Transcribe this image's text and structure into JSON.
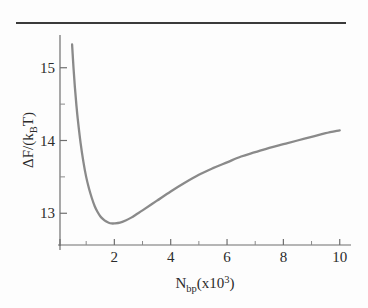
{
  "figure": {
    "background_color": "#fdfdfd",
    "rule_color": "#3a3a3a",
    "curve_color": "#8a8a8a",
    "axis_color": "#6f6f6f",
    "text_color": "#2b2b2b"
  },
  "axis_titles": {
    "y_delta": "Δ",
    "y_f_slash": "F/(k",
    "y_sub": "B",
    "y_tail": "T)",
    "x_n": "N",
    "x_sub": "bp",
    "x_paren_open": "(x10",
    "x_sup": "3",
    "x_paren_close": ")"
  },
  "ticks": {
    "x_major_labels": [
      "2",
      "4",
      "6",
      "8",
      "10"
    ],
    "y_major_labels": [
      "13",
      "14",
      "15"
    ]
  },
  "chart_data": {
    "type": "line",
    "title": "",
    "xlabel": "N_bp(x10^3)",
    "ylabel": "ΔF/(k_B T)",
    "xlim": [
      0,
      10.4
    ],
    "ylim": [
      12.55,
      15.45
    ],
    "grid": false,
    "legend": null,
    "x_ticks_major": [
      2,
      4,
      6,
      8,
      10
    ],
    "x_ticks_minor": [
      1,
      3,
      5,
      7,
      9
    ],
    "y_ticks_major": [
      13,
      14,
      15
    ],
    "y_ticks_minor": [
      13.5,
      14.5
    ],
    "series": [
      {
        "name": "Free energy difference",
        "color": "#8a8a8a",
        "minimum": {
          "x": 2.0,
          "y": 12.87
        },
        "x": [
          0.5,
          0.55,
          0.6,
          0.65,
          0.7,
          0.8,
          0.9,
          1.0,
          1.1,
          1.2,
          1.3,
          1.4,
          1.5,
          1.6,
          1.7,
          1.8,
          1.9,
          2.0,
          2.2,
          2.4,
          2.6,
          2.8,
          3.0,
          3.5,
          4.0,
          4.5,
          5.0,
          5.5,
          6.0,
          6.5,
          7.0,
          7.5,
          8.0,
          8.5,
          9.0,
          9.5,
          10.0
        ],
        "y": [
          15.32,
          15.0,
          14.73,
          14.5,
          14.3,
          13.97,
          13.71,
          13.5,
          13.34,
          13.21,
          13.1,
          13.02,
          12.96,
          12.92,
          12.89,
          12.87,
          12.86,
          12.86,
          12.87,
          12.9,
          12.94,
          12.99,
          13.04,
          13.17,
          13.3,
          13.42,
          13.53,
          13.62,
          13.7,
          13.78,
          13.84,
          13.9,
          13.95,
          14.0,
          14.05,
          14.1,
          14.14
        ]
      }
    ]
  }
}
